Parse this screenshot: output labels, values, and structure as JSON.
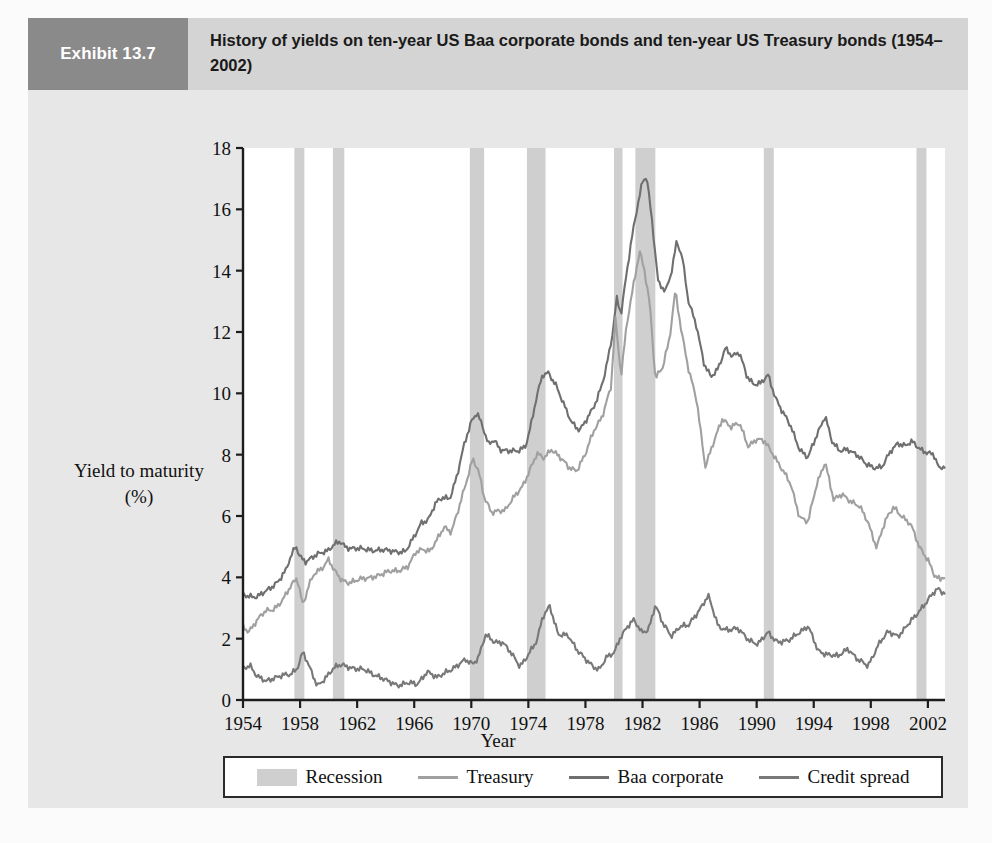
{
  "exhibit": {
    "tag": "Exhibit 13.7",
    "title": "History of yields on ten-year US Baa corporate bonds and ten-year US Treasury bonds (1954–2002)"
  },
  "colors": {
    "tag_bg": "#8a8a8a",
    "header_bg": "#d4d4d4",
    "panel_bg": "#e7e7e7",
    "plot_bg": "#ffffff",
    "recession": "#cfcfcf",
    "treasury": "#a0a0a0",
    "baa": "#6f6f6f",
    "spread": "#787878",
    "axis": "#1d1d1d"
  },
  "legend": {
    "items": [
      {
        "label": "Recession",
        "type": "swatch",
        "color": "#cfcfcf"
      },
      {
        "label": "Treasury",
        "type": "line",
        "color": "#a0a0a0"
      },
      {
        "label": "Baa corporate",
        "type": "line",
        "color": "#6f6f6f"
      },
      {
        "label": "Credit spread",
        "type": "line",
        "color": "#787878"
      }
    ]
  },
  "chart_data": {
    "type": "line",
    "title": "History of yields on ten-year US Baa corporate bonds and ten-year US Treasury bonds (1954–2002)",
    "xlabel": "Year",
    "ylabel": "Yield to maturity (%)",
    "ylabel_lines": [
      "Yield to maturity",
      "(%)"
    ],
    "xlim": [
      1954,
      2003.2
    ],
    "ylim": [
      0,
      18
    ],
    "yticks": [
      0,
      2,
      4,
      6,
      8,
      10,
      12,
      14,
      16,
      18
    ],
    "xticks": [
      1954,
      1958,
      1962,
      1966,
      1970,
      1974,
      1978,
      1982,
      1986,
      1990,
      1994,
      1998,
      2002
    ],
    "grid": false,
    "legend_position": "bottom",
    "recessions": [
      {
        "start": 1957.6,
        "end": 1958.3
      },
      {
        "start": 1960.3,
        "end": 1961.1
      },
      {
        "start": 1969.9,
        "end": 1970.9
      },
      {
        "start": 1973.9,
        "end": 1975.2
      },
      {
        "start": 1980.0,
        "end": 1980.6
      },
      {
        "start": 1981.5,
        "end": 1982.9
      },
      {
        "start": 1990.5,
        "end": 1991.2
      },
      {
        "start": 2001.2,
        "end": 2001.9
      }
    ],
    "series": [
      {
        "name": "Baa corporate",
        "color": "#6f6f6f",
        "x": [
          1954.0,
          1954.5,
          1955.0,
          1955.5,
          1956.0,
          1956.5,
          1957.0,
          1957.3,
          1957.7,
          1958.0,
          1958.4,
          1958.8,
          1959.2,
          1959.6,
          1960.0,
          1960.4,
          1960.8,
          1961.2,
          1961.8,
          1962.4,
          1963.0,
          1963.6,
          1964.2,
          1964.8,
          1965.4,
          1966.0,
          1966.5,
          1967.0,
          1967.5,
          1968.0,
          1968.5,
          1969.0,
          1969.5,
          1970.0,
          1970.4,
          1970.8,
          1971.2,
          1971.6,
          1972.0,
          1972.6,
          1973.2,
          1973.8,
          1974.2,
          1974.6,
          1975.0,
          1975.4,
          1975.9,
          1976.4,
          1977.0,
          1977.6,
          1978.2,
          1978.8,
          1979.4,
          1979.9,
          1980.2,
          1980.5,
          1980.9,
          1981.3,
          1981.7,
          1982.0,
          1982.3,
          1982.7,
          1983.1,
          1983.6,
          1984.0,
          1984.4,
          1984.8,
          1985.2,
          1985.8,
          1986.3,
          1986.8,
          1987.3,
          1987.8,
          1988.3,
          1988.8,
          1989.3,
          1989.8,
          1990.3,
          1990.8,
          1991.3,
          1991.8,
          1992.4,
          1993.0,
          1993.6,
          1994.2,
          1994.8,
          1995.3,
          1995.8,
          1996.4,
          1997.0,
          1997.6,
          1998.2,
          1998.8,
          1999.4,
          1999.9,
          2000.4,
          2000.9,
          2001.4,
          2001.9,
          2002.4,
          2002.8,
          2003.0
        ],
        "y": [
          3.45,
          3.4,
          3.35,
          3.5,
          3.7,
          3.9,
          4.2,
          4.6,
          5.05,
          4.7,
          4.5,
          4.6,
          4.75,
          4.85,
          4.9,
          5.05,
          5.15,
          5.0,
          4.95,
          4.9,
          4.9,
          4.9,
          4.85,
          4.85,
          4.85,
          5.3,
          5.8,
          5.9,
          6.4,
          6.6,
          6.6,
          7.3,
          8.3,
          9.1,
          9.4,
          8.9,
          8.3,
          8.5,
          8.2,
          8.1,
          8.1,
          8.3,
          9.0,
          9.9,
          10.6,
          10.7,
          10.3,
          9.7,
          9.1,
          8.8,
          9.2,
          9.8,
          10.7,
          11.9,
          13.1,
          12.6,
          14.0,
          15.2,
          16.2,
          16.9,
          17.1,
          15.5,
          13.6,
          13.3,
          13.9,
          15.0,
          14.4,
          13.0,
          12.2,
          11.0,
          10.5,
          10.8,
          11.5,
          11.2,
          11.3,
          10.6,
          10.3,
          10.3,
          10.6,
          9.9,
          9.4,
          8.9,
          8.2,
          7.9,
          8.6,
          9.3,
          8.4,
          8.1,
          8.2,
          8.0,
          7.7,
          7.6,
          7.6,
          8.1,
          8.4,
          8.3,
          8.4,
          8.2,
          8.1,
          8.0,
          7.5,
          7.6
        ],
        "peak": 17.2,
        "peak_year": 1982.2
      },
      {
        "name": "Treasury",
        "color": "#a0a0a0",
        "x": [
          1954.0,
          1954.4,
          1955.0,
          1955.6,
          1956.0,
          1956.5,
          1957.0,
          1957.4,
          1957.8,
          1958.2,
          1958.6,
          1959.0,
          1959.5,
          1960.0,
          1960.4,
          1960.9,
          1961.4,
          1962.0,
          1962.6,
          1963.2,
          1963.8,
          1964.4,
          1965.0,
          1965.6,
          1966.1,
          1966.6,
          1967.1,
          1967.6,
          1968.1,
          1968.6,
          1969.1,
          1969.6,
          1970.1,
          1970.5,
          1970.9,
          1971.4,
          1971.9,
          1972.4,
          1973.0,
          1973.6,
          1974.1,
          1974.6,
          1975.1,
          1975.6,
          1976.2,
          1976.8,
          1977.4,
          1978.0,
          1978.6,
          1979.2,
          1979.8,
          1980.1,
          1980.5,
          1980.9,
          1981.4,
          1981.8,
          1982.1,
          1982.5,
          1982.9,
          1983.4,
          1983.9,
          1984.3,
          1984.7,
          1985.2,
          1985.8,
          1986.4,
          1987.0,
          1987.6,
          1988.2,
          1988.8,
          1989.4,
          1990.0,
          1990.6,
          1991.2,
          1991.8,
          1992.4,
          1993.0,
          1993.6,
          1994.2,
          1994.8,
          1995.4,
          1996.0,
          1996.6,
          1997.2,
          1997.8,
          1998.4,
          1999.0,
          1999.6,
          2000.2,
          2000.8,
          2001.4,
          2002.0,
          2002.5,
          2002.9,
          2003.0
        ],
        "y": [
          2.4,
          2.25,
          2.6,
          2.9,
          2.95,
          3.1,
          3.4,
          3.75,
          4.0,
          3.1,
          3.7,
          4.1,
          4.3,
          4.6,
          4.2,
          3.9,
          3.85,
          3.9,
          3.95,
          4.05,
          4.1,
          4.2,
          4.25,
          4.35,
          4.8,
          4.95,
          4.85,
          5.2,
          5.65,
          5.5,
          6.2,
          7.0,
          7.9,
          7.5,
          6.6,
          6.1,
          6.2,
          6.2,
          6.6,
          7.0,
          7.5,
          8.0,
          7.9,
          8.2,
          7.9,
          7.6,
          7.5,
          8.0,
          8.8,
          9.3,
          10.2,
          12.4,
          10.6,
          12.3,
          13.6,
          14.6,
          14.1,
          13.0,
          10.5,
          10.8,
          11.8,
          13.4,
          12.1,
          10.8,
          9.8,
          7.6,
          8.4,
          9.2,
          8.9,
          9.0,
          8.3,
          8.5,
          8.4,
          8.0,
          7.5,
          7.0,
          6.0,
          5.8,
          7.0,
          7.8,
          6.5,
          6.7,
          6.5,
          6.3,
          5.8,
          5.0,
          5.8,
          6.3,
          6.0,
          5.7,
          5.0,
          4.6,
          4.0,
          3.9,
          4.0
        ],
        "peak": 15.3,
        "peak_year": 1981.8
      },
      {
        "name": "Credit spread",
        "color": "#787878",
        "x": [
          1954.0,
          1954.5,
          1955.0,
          1955.6,
          1956.2,
          1956.8,
          1957.3,
          1957.8,
          1958.2,
          1958.7,
          1959.2,
          1959.8,
          1960.3,
          1960.9,
          1961.4,
          1962.0,
          1962.7,
          1963.4,
          1964.1,
          1964.8,
          1965.5,
          1966.2,
          1966.9,
          1967.6,
          1968.3,
          1969.0,
          1969.6,
          1970.1,
          1970.5,
          1971.0,
          1971.6,
          1972.2,
          1972.8,
          1973.4,
          1974.0,
          1974.6,
          1975.0,
          1975.5,
          1976.1,
          1976.8,
          1977.5,
          1978.2,
          1978.9,
          1979.5,
          1980.0,
          1980.4,
          1980.9,
          1981.4,
          1981.9,
          1982.4,
          1982.9,
          1983.4,
          1984.0,
          1984.6,
          1985.2,
          1985.9,
          1986.6,
          1987.3,
          1988.0,
          1988.7,
          1989.4,
          1990.1,
          1990.8,
          1991.5,
          1992.2,
          1992.9,
          1993.6,
          1994.3,
          1995.0,
          1995.7,
          1996.4,
          1997.1,
          1997.8,
          1998.5,
          1999.2,
          1999.9,
          2000.5,
          2001.1,
          2001.7,
          2002.2,
          2002.7,
          2003.0
        ],
        "y": [
          1.05,
          1.15,
          0.75,
          0.6,
          0.75,
          0.8,
          0.8,
          1.05,
          1.6,
          1.0,
          0.45,
          0.75,
          1.0,
          1.15,
          1.1,
          1.0,
          0.95,
          0.8,
          0.6,
          0.5,
          0.55,
          0.5,
          0.95,
          0.7,
          0.95,
          1.1,
          1.3,
          1.2,
          1.4,
          2.1,
          1.9,
          1.9,
          1.5,
          1.1,
          1.5,
          1.9,
          2.7,
          3.1,
          2.1,
          2.1,
          1.6,
          1.2,
          1.0,
          1.4,
          1.5,
          2.0,
          2.4,
          2.6,
          2.2,
          2.3,
          3.1,
          2.5,
          2.1,
          2.4,
          2.4,
          2.9,
          3.4,
          2.4,
          2.3,
          2.3,
          2.0,
          1.8,
          2.2,
          1.9,
          1.9,
          2.2,
          2.4,
          1.6,
          1.5,
          1.4,
          1.7,
          1.3,
          1.1,
          1.8,
          2.2,
          2.1,
          2.4,
          2.7,
          3.1,
          3.4,
          3.6,
          3.5
        ],
        "peak": 3.8,
        "peak_year": 1982.8
      }
    ]
  }
}
